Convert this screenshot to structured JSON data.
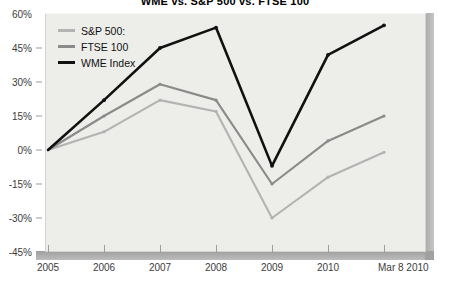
{
  "chart_data": {
    "type": "line",
    "title": "WME vs. S&P 500 vs. FTSE 100",
    "xlabel": "",
    "ylabel": "",
    "grid": false,
    "legend_position": "top-left",
    "categories": [
      "2005",
      "2006",
      "2007",
      "2008",
      "2009",
      "2010",
      "Mar 8 2010"
    ],
    "x_tick_labels": [
      "2005",
      "2006",
      "2007",
      "2008",
      "2009",
      "2010",
      "Mar 8 2010"
    ],
    "y_tick_labels": [
      "60%",
      "45%",
      "30%",
      "15%",
      "0%",
      "-15%",
      "-30%",
      "-45%"
    ],
    "y_tick_values": [
      60,
      45,
      30,
      15,
      0,
      -15,
      -30,
      -45
    ],
    "ylim": [
      -45,
      60
    ],
    "series": [
      {
        "name": "S&P 500:",
        "color": "#b3b3b3",
        "values": [
          0,
          8,
          22,
          17,
          -30,
          -12,
          -1
        ]
      },
      {
        "name": "FTSE 100",
        "color": "#8a8a8a",
        "values": [
          0,
          15,
          29,
          22,
          -15,
          4,
          15
        ]
      },
      {
        "name": "WME Index",
        "color": "#111111",
        "values": [
          0,
          22,
          45,
          54,
          -7,
          42,
          55
        ]
      }
    ]
  },
  "legend": {
    "items": [
      {
        "label": "S&P 500:",
        "color": "#b3b3b3",
        "icon": "line-swatch-icon"
      },
      {
        "label": "FTSE 100",
        "color": "#8a8a8a",
        "icon": "line-swatch-icon"
      },
      {
        "label": "WME Index",
        "color": "#111111",
        "icon": "line-swatch-icon"
      }
    ]
  }
}
